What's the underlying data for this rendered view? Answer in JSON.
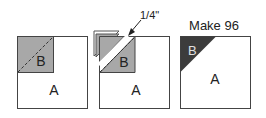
{
  "diagram": {
    "steps": [
      {
        "id": "step-1",
        "labels": {
          "large": "A",
          "small": "B"
        }
      },
      {
        "id": "step-2",
        "labels": {
          "large": "A",
          "small": "B"
        },
        "annotation": "1/4\""
      },
      {
        "id": "step-3",
        "labels": {
          "large": "A",
          "small": "B"
        },
        "caption": "Make 96"
      }
    ],
    "colors": {
      "fabric_b": "#a8a8a8",
      "fabric_b_dark": "#3c3c3c",
      "outline": "#444444",
      "background": "#ffffff"
    }
  }
}
